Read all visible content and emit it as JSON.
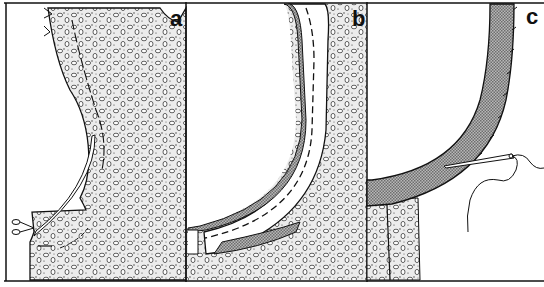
{
  "figure": {
    "panels": [
      {
        "id": "a",
        "label": "a",
        "description": "Garment front with fabric pattern, armhole curve being clipped with scissors"
      },
      {
        "id": "b",
        "label": "b",
        "description": "Facing sewn to armhole, understitched with dashed stitch line"
      },
      {
        "id": "c",
        "label": "c",
        "description": "Facing turned under and hand-stitched with needle and thread"
      }
    ],
    "colors": {
      "ink": "#111111",
      "fabric_fill": "#e6e6e6",
      "facing_fill": "#9a9a9a",
      "background": "#ffffff"
    }
  }
}
